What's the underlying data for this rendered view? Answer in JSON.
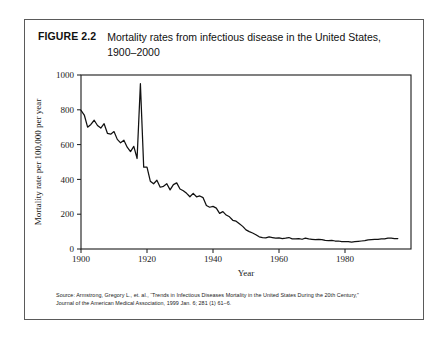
{
  "figure": {
    "number": "FIGURE 2.2",
    "title": "Mortality rates from infectious disease in the United States, 1900–2000",
    "source_line1": "Source: Armstrong, Gregory L., et. al., “Trends in Infectious Diseases Mortality in the United States During the 20th Century,”",
    "source_line2": "Journal of the American Medical Association, 1999 Jan. 6; 281 (1) 61–6."
  },
  "chart_data": {
    "type": "line",
    "title": "Mortality rates from infectious disease in the United States, 1900–2000",
    "xlabel": "Year",
    "ylabel": "Mortality rate per 100,000 per year",
    "xlim": [
      1900,
      2000
    ],
    "ylim": [
      0,
      1000
    ],
    "xticks": [
      1900,
      1920,
      1940,
      1960,
      1980
    ],
    "yticks": [
      0,
      200,
      400,
      600,
      800,
      1000
    ],
    "grid": false,
    "legend": "none",
    "line_color": "#111111",
    "x": [
      1900,
      1901,
      1902,
      1903,
      1904,
      1905,
      1906,
      1907,
      1908,
      1909,
      1910,
      1911,
      1912,
      1913,
      1914,
      1915,
      1916,
      1917,
      1918,
      1919,
      1920,
      1921,
      1922,
      1923,
      1924,
      1925,
      1926,
      1927,
      1928,
      1929,
      1930,
      1931,
      1932,
      1933,
      1934,
      1935,
      1936,
      1937,
      1938,
      1939,
      1940,
      1941,
      1942,
      1943,
      1944,
      1945,
      1946,
      1947,
      1948,
      1949,
      1950,
      1951,
      1952,
      1953,
      1954,
      1955,
      1956,
      1957,
      1958,
      1959,
      1960,
      1961,
      1962,
      1963,
      1964,
      1965,
      1966,
      1967,
      1968,
      1969,
      1970,
      1971,
      1972,
      1973,
      1974,
      1975,
      1976,
      1977,
      1978,
      1979,
      1980,
      1981,
      1982,
      1983,
      1984,
      1985,
      1986,
      1987,
      1988,
      1989,
      1990,
      1991,
      1992,
      1993,
      1994,
      1995,
      1996
    ],
    "values": [
      797,
      770,
      700,
      716,
      740,
      710,
      695,
      720,
      665,
      660,
      675,
      630,
      610,
      625,
      585,
      560,
      590,
      520,
      950,
      470,
      470,
      390,
      375,
      395,
      355,
      360,
      375,
      340,
      370,
      380,
      345,
      335,
      320,
      300,
      320,
      300,
      305,
      295,
      250,
      240,
      245,
      235,
      205,
      215,
      195,
      185,
      165,
      160,
      145,
      130,
      110,
      100,
      92,
      82,
      70,
      66,
      64,
      70,
      66,
      62,
      64,
      60,
      62,
      66,
      58,
      58,
      60,
      56,
      62,
      58,
      56,
      54,
      56,
      54,
      50,
      48,
      50,
      46,
      46,
      42,
      42,
      42,
      40,
      42,
      44,
      46,
      48,
      52,
      54,
      56,
      56,
      58,
      58,
      62,
      62,
      60,
      60
    ]
  }
}
